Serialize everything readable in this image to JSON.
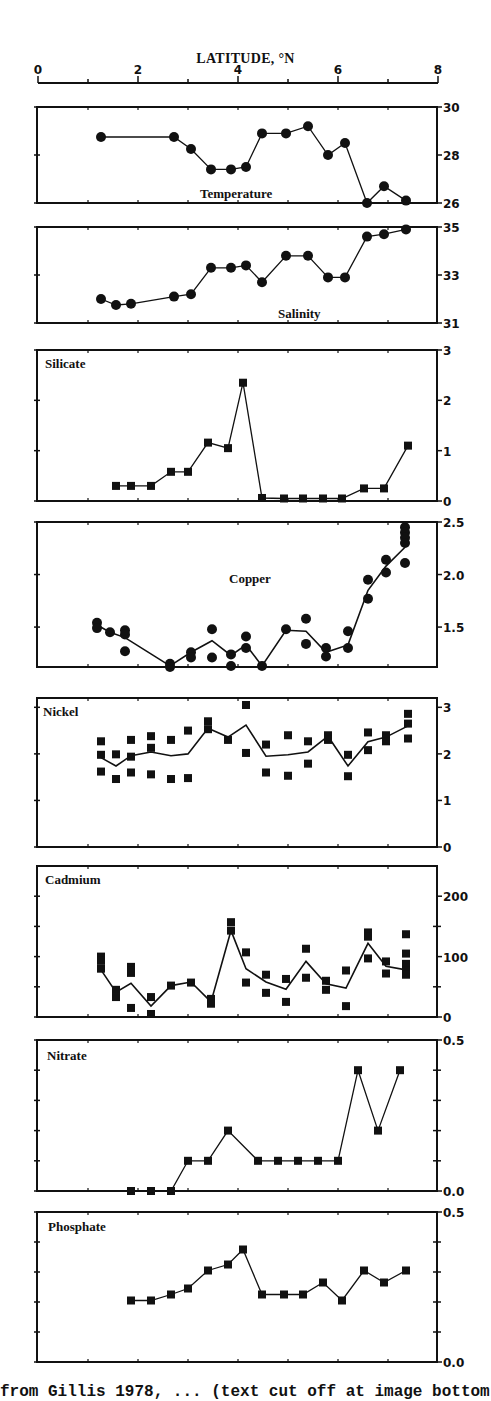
{
  "figure": {
    "top_axis": {
      "title": "LATITUDE, °N",
      "ticks": [
        "0",
        "2",
        "4",
        "6",
        "8"
      ],
      "range": [
        0,
        8
      ]
    },
    "caption": "from Gillis 1978, ... (text cut off at image bottom)"
  },
  "chart_data": [
    {
      "type": "line",
      "title": "Temperature",
      "xlabel": "LATITUDE, °N",
      "ylabel": "",
      "xlim": [
        0,
        8
      ],
      "ylim": [
        26,
        30
      ],
      "yticks": [
        "26",
        "28",
        "30"
      ],
      "marker": "circle",
      "series": [
        {
          "name": "Temperature",
          "x": [
            1.26,
            2.72,
            3.06,
            3.46,
            3.86,
            4.16,
            4.48,
            4.96,
            5.4,
            5.8,
            6.14,
            6.58,
            6.92,
            7.36
          ],
          "y": [
            28.75,
            28.75,
            28.25,
            27.4,
            27.4,
            27.5,
            28.9,
            28.9,
            29.2,
            28.0,
            28.5,
            26.0,
            26.7,
            26.1
          ]
        }
      ]
    },
    {
      "type": "line",
      "title": "Salinity",
      "xlim": [
        0,
        8
      ],
      "ylim": [
        31,
        35
      ],
      "yticks": [
        "31",
        "33",
        "35"
      ],
      "marker": "circle",
      "series": [
        {
          "name": "Salinity",
          "x": [
            1.26,
            1.56,
            1.86,
            2.72,
            3.06,
            3.46,
            3.86,
            4.16,
            4.48,
            4.96,
            5.4,
            5.8,
            6.14,
            6.58,
            6.92,
            7.36
          ],
          "y": [
            32.0,
            31.75,
            31.8,
            32.1,
            32.2,
            33.3,
            33.3,
            33.4,
            32.7,
            33.8,
            33.8,
            32.9,
            32.9,
            34.6,
            34.7,
            34.9
          ]
        }
      ]
    },
    {
      "type": "line",
      "title": "Silicate",
      "xlim": [
        0,
        8
      ],
      "ylim": [
        0,
        3
      ],
      "yticks": [
        "0",
        "1",
        "2",
        "3"
      ],
      "marker": "square",
      "series": [
        {
          "name": "Silicate",
          "x": [
            1.56,
            1.86,
            2.26,
            2.66,
            3.0,
            3.4,
            3.8,
            4.1,
            4.48,
            4.92,
            5.3,
            5.7,
            6.08,
            6.52,
            6.92,
            7.4
          ],
          "y": [
            0.3,
            0.3,
            0.3,
            0.58,
            0.58,
            1.16,
            1.05,
            2.35,
            0.06,
            0.05,
            0.05,
            0.05,
            0.05,
            0.25,
            0.25,
            1.1
          ]
        }
      ]
    },
    {
      "type": "scatter",
      "title": "Copper",
      "xlim": [
        0,
        8
      ],
      "ylim": [
        1.12,
        2.5
      ],
      "yticks": [
        "1.5",
        "2.0",
        "2.5"
      ],
      "marker": "circle",
      "points": {
        "x": [
          1.18,
          1.18,
          1.44,
          1.74,
          1.74,
          1.74,
          2.64,
          2.64,
          3.06,
          3.06,
          3.48,
          3.48,
          3.86,
          3.86,
          4.16,
          4.16,
          4.48,
          4.96,
          5.36,
          5.36,
          5.76,
          5.76,
          6.2,
          6.2,
          6.6,
          6.6,
          6.96,
          6.96,
          7.34,
          7.34,
          7.34,
          7.34,
          7.34
        ],
        "y": [
          1.54,
          1.49,
          1.45,
          1.47,
          1.43,
          1.27,
          1.15,
          1.08,
          1.26,
          1.21,
          1.48,
          1.21,
          1.24,
          1.13,
          1.41,
          1.3,
          1.13,
          1.48,
          1.58,
          1.34,
          1.3,
          1.22,
          1.46,
          1.3,
          1.95,
          1.77,
          2.14,
          2.02,
          2.45,
          2.4,
          2.35,
          2.3,
          2.11
        ]
      },
      "series": [
        {
          "name": "Copper mean",
          "x": [
            1.18,
            1.44,
            1.74,
            2.64,
            3.06,
            3.48,
            3.86,
            4.16,
            4.48,
            4.96,
            5.36,
            5.76,
            6.2,
            6.6,
            6.96,
            7.34
          ],
          "y": [
            1.52,
            1.45,
            1.4,
            1.13,
            1.26,
            1.37,
            1.23,
            1.33,
            1.13,
            1.47,
            1.46,
            1.26,
            1.33,
            1.85,
            2.08,
            2.26
          ]
        }
      ]
    },
    {
      "type": "scatter",
      "title": "Nickel",
      "xlim": [
        0,
        8
      ],
      "ylim": [
        0,
        3.2
      ],
      "yticks": [
        "0",
        "1",
        "2",
        "3"
      ],
      "marker": "square",
      "points": {
        "x": [
          1.26,
          1.26,
          1.26,
          1.56,
          1.56,
          1.86,
          1.86,
          1.86,
          2.26,
          2.26,
          2.26,
          2.66,
          2.66,
          3.0,
          3.0,
          3.4,
          3.4,
          3.8,
          4.16,
          4.16,
          4.56,
          4.56,
          5.0,
          5.0,
          5.4,
          5.4,
          5.8,
          5.8,
          6.2,
          6.2,
          6.6,
          6.6,
          6.96,
          6.96,
          7.4,
          7.4,
          7.4
        ],
        "y": [
          2.27,
          1.98,
          1.62,
          1.99,
          1.46,
          2.3,
          1.94,
          1.6,
          2.38,
          2.13,
          1.56,
          2.3,
          1.46,
          2.5,
          1.48,
          2.7,
          2.53,
          2.3,
          3.05,
          2.02,
          2.2,
          1.6,
          2.4,
          1.53,
          2.27,
          1.79,
          2.4,
          2.3,
          1.98,
          1.52,
          2.46,
          2.08,
          2.4,
          2.27,
          2.86,
          2.65,
          2.33
        ]
      },
      "series": [
        {
          "name": "Nickel mean",
          "x": [
            1.26,
            1.56,
            1.86,
            2.26,
            2.66,
            3.0,
            3.4,
            3.8,
            4.16,
            4.56,
            5.0,
            5.4,
            5.8,
            6.2,
            6.6,
            6.96,
            7.4
          ],
          "y": [
            1.92,
            1.74,
            1.96,
            2.04,
            1.96,
            2.0,
            2.55,
            2.36,
            2.62,
            1.95,
            1.98,
            2.04,
            2.38,
            1.74,
            2.26,
            2.36,
            2.6
          ]
        }
      ]
    },
    {
      "type": "scatter",
      "title": "Cadmium",
      "xlim": [
        0,
        8
      ],
      "ylim": [
        0,
        250
      ],
      "yticks": [
        "0",
        "100",
        "200"
      ],
      "marker": "square",
      "points": {
        "x": [
          1.26,
          1.26,
          1.26,
          1.56,
          1.56,
          1.86,
          1.86,
          1.86,
          1.86,
          2.26,
          2.26,
          2.66,
          3.06,
          3.46,
          3.46,
          3.86,
          3.86,
          4.16,
          4.16,
          4.56,
          4.56,
          4.96,
          4.96,
          5.36,
          5.36,
          5.76,
          5.76,
          6.16,
          6.16,
          6.6,
          6.6,
          6.6,
          6.96,
          6.96,
          7.36,
          7.36,
          7.36,
          7.36,
          7.36
        ],
        "y": [
          100,
          93,
          80,
          45,
          33,
          83,
          73,
          77,
          15,
          33,
          5,
          52,
          57,
          30,
          22,
          157,
          143,
          107,
          57,
          70,
          40,
          63,
          25,
          113,
          65,
          60,
          45,
          77,
          18,
          140,
          133,
          97,
          92,
          72,
          137,
          105,
          88,
          77,
          70
        ]
      },
      "series": [
        {
          "name": "Cadmium mean",
          "x": [
            1.26,
            1.56,
            1.86,
            2.26,
            2.66,
            3.06,
            3.46,
            3.86,
            4.16,
            4.56,
            4.96,
            5.36,
            5.76,
            6.16,
            6.6,
            6.96,
            7.36
          ],
          "y": [
            78,
            41,
            56,
            18,
            52,
            58,
            25,
            143,
            80,
            58,
            46,
            92,
            55,
            48,
            122,
            84,
            78
          ]
        }
      ]
    },
    {
      "type": "line",
      "title": "Nitrate",
      "xlim": [
        0,
        8
      ],
      "ylim": [
        0,
        0.5
      ],
      "yticks": [
        "0.0",
        "0.5"
      ],
      "marker": "square",
      "series": [
        {
          "name": "Nitrate",
          "x": [
            1.86,
            2.26,
            2.66,
            3.0,
            3.4,
            3.8,
            4.4,
            4.8,
            5.2,
            5.6,
            6.0,
            6.4,
            6.8,
            7.24
          ],
          "y": [
            0.0,
            0.0,
            0.0,
            0.1,
            0.1,
            0.2,
            0.1,
            0.1,
            0.1,
            0.1,
            0.1,
            0.4,
            0.2,
            0.4
          ]
        }
      ]
    },
    {
      "type": "line",
      "title": "Phosphate",
      "xlim": [
        0,
        8
      ],
      "ylim": [
        0,
        0.5
      ],
      "yticks": [
        "0.0",
        "0.5"
      ],
      "marker": "square",
      "series": [
        {
          "name": "Phosphate",
          "x": [
            1.86,
            2.26,
            2.66,
            3.0,
            3.4,
            3.8,
            4.1,
            4.48,
            4.92,
            5.3,
            5.7,
            6.08,
            6.52,
            6.92,
            7.36
          ],
          "y": [
            0.205,
            0.205,
            0.225,
            0.245,
            0.305,
            0.325,
            0.375,
            0.225,
            0.225,
            0.225,
            0.265,
            0.205,
            0.305,
            0.265,
            0.305
          ]
        }
      ]
    }
  ],
  "layout": {
    "panels": [
      {
        "top": 107,
        "bottom": 203,
        "label_pos": "bottom-center",
        "label_x": 200,
        "label_y": 198
      },
      {
        "top": 227,
        "bottom": 323,
        "label_pos": "bottom-center",
        "label_x": 278,
        "label_y": 318
      },
      {
        "top": 350,
        "bottom": 501,
        "label_pos": "top-left",
        "label_x": 45,
        "label_y": 368
      },
      {
        "top": 522,
        "bottom": 667,
        "label_pos": "center",
        "label_x": 229,
        "label_y": 583
      },
      {
        "top": 698,
        "bottom": 847,
        "label_pos": "top-left",
        "label_x": 43,
        "label_y": 716
      },
      {
        "top": 866,
        "bottom": 1017,
        "label_pos": "top-left",
        "label_x": 45,
        "label_y": 884
      },
      {
        "top": 1040,
        "bottom": 1191,
        "label_pos": "top-left",
        "label_x": 47,
        "label_y": 1060
      },
      {
        "top": 1212,
        "bottom": 1362,
        "label_pos": "top-left",
        "label_x": 48,
        "label_y": 1231
      }
    ],
    "left": 37,
    "right": 437,
    "x0_px": 38,
    "x_per_unit": 50,
    "ink": "#111111"
  }
}
